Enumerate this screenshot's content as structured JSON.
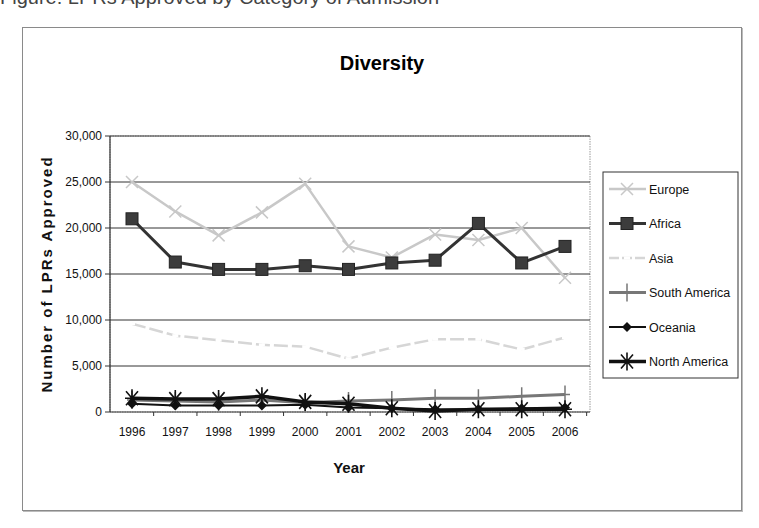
{
  "chart_data": {
    "type": "line",
    "title": "Diversity",
    "xlabel": "Year",
    "ylabel": "Number of LPRs Approved",
    "ylim": [
      0,
      30000
    ],
    "yticks": [
      0,
      5000,
      10000,
      15000,
      20000,
      25000,
      30000
    ],
    "ytick_labels": [
      "0",
      "5,000",
      "10,000",
      "15,000",
      "20,000",
      "25,000",
      "30,000"
    ],
    "grid": true,
    "legend_position": "right",
    "categories": [
      "1996",
      "1997",
      "1998",
      "1999",
      "2000",
      "2001",
      "2002",
      "2003",
      "2004",
      "2005",
      "2006"
    ],
    "series": [
      {
        "name": "Europe",
        "color": "#c8c8c8",
        "marker": "x",
        "width": 2.5,
        "values": [
          25000,
          21800,
          19200,
          21700,
          24800,
          18000,
          16800,
          19300,
          18700,
          20000,
          14600
        ]
      },
      {
        "name": "Africa",
        "color": "#333333",
        "marker": "square",
        "width": 3,
        "values": [
          21000,
          16300,
          15500,
          15500,
          15900,
          15500,
          16200,
          16500,
          20500,
          16200,
          18000
        ]
      },
      {
        "name": "Asia",
        "color": "#d6d6d6",
        "marker": "dash",
        "width": 2.5,
        "values": [
          9600,
          8300,
          7800,
          7300,
          7100,
          5800,
          7000,
          7900,
          7900,
          6800,
          8100
        ]
      },
      {
        "name": "South America",
        "color": "#777777",
        "marker": "plus",
        "width": 3,
        "values": [
          1300,
          1200,
          1100,
          1300,
          1000,
          1200,
          1300,
          1500,
          1500,
          1700,
          1900
        ]
      },
      {
        "name": "Oceania",
        "color": "#111111",
        "marker": "diamond",
        "width": 2,
        "values": [
          900,
          700,
          700,
          700,
          800,
          500,
          400,
          300,
          300,
          400,
          500
        ]
      },
      {
        "name": "North America",
        "color": "#111111",
        "marker": "star",
        "width": 3.5,
        "values": [
          1500,
          1400,
          1400,
          1700,
          1100,
          900,
          400,
          100,
          300,
          300,
          300
        ]
      }
    ]
  },
  "page": {
    "cut_text": "Figure: LPRs Approved by Category of Admission"
  }
}
